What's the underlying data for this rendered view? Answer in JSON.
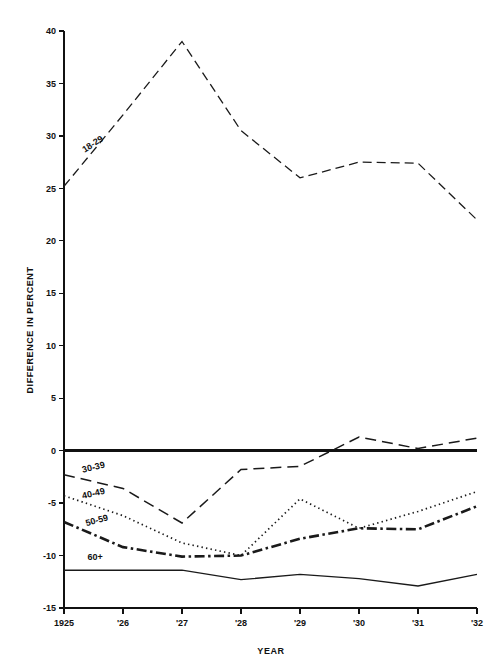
{
  "chart_data": {
    "type": "line",
    "title": "",
    "xlabel": "YEAR",
    "ylabel": "DIFFERENCE IN PERCENT",
    "x": [
      1925,
      1926,
      1927,
      1928,
      1929,
      1930,
      1931,
      1932
    ],
    "xtick_labels": [
      "1925",
      "'26",
      "'27",
      "'28",
      "'29",
      "'30",
      "'31",
      "'32"
    ],
    "ytick_labels": [
      "40",
      "35",
      "30",
      "25",
      "20",
      "15",
      "10",
      "5",
      "0",
      "-5",
      "-10",
      "-15"
    ],
    "ytick_values": [
      40,
      35,
      30,
      25,
      20,
      15,
      10,
      5,
      0,
      -5,
      -10,
      -15
    ],
    "xlim": [
      1925,
      1932
    ],
    "ylim": [
      -15,
      40
    ],
    "grid": false,
    "legend_position": "inline-labels",
    "zero_reference_line": 0,
    "series": [
      {
        "name": "18-29",
        "label": "18-29",
        "dash": "9,5",
        "width": 1.3,
        "label_x": 1925.35,
        "label_y": 28.4,
        "label_rotate": -33,
        "values": [
          25.2,
          32.0,
          39.0,
          30.5,
          26.0,
          27.5,
          27.4,
          22.0
        ]
      },
      {
        "name": "30-39",
        "label": "30-39",
        "dash": "11,6",
        "width": 1.5,
        "label_x": 1925.32,
        "label_y": -2.1,
        "label_rotate": -13,
        "values": [
          -2.3,
          -3.6,
          -6.9,
          -1.8,
          -1.5,
          1.3,
          0.2,
          1.2
        ]
      },
      {
        "name": "40-49",
        "label": "40-49",
        "dash": "1.4,3.2",
        "width": 1.7,
        "label_x": 1925.32,
        "label_y": -4.6,
        "label_rotate": -13,
        "values": [
          -4.3,
          -6.2,
          -8.8,
          -10.0,
          -4.6,
          -7.4,
          -5.8,
          -3.9
        ]
      },
      {
        "name": "50-59",
        "label": "50-59",
        "dash": "10,3.5,2.5,3.5",
        "width": 2.6,
        "label_x": 1925.38,
        "label_y": -7.2,
        "label_rotate": -15,
        "values": [
          -6.8,
          -9.2,
          -10.1,
          -10.0,
          -8.4,
          -7.4,
          -7.5,
          -5.3
        ]
      },
      {
        "name": "60+",
        "label": "60+",
        "dash": "none",
        "width": 1.3,
        "label_x": 1925.4,
        "label_y": -10.4,
        "label_rotate": 0,
        "values": [
          -11.4,
          -11.4,
          -11.4,
          -12.3,
          -11.8,
          -12.2,
          -12.9,
          -11.8
        ]
      }
    ],
    "colors": {
      "axis": "#111111",
      "line": "#1a1a1a",
      "background": "#ffffff"
    }
  }
}
